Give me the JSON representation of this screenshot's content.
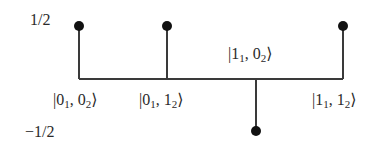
{
  "diagram": {
    "y_labels": {
      "top": "1/2",
      "bottom": "−1/2"
    },
    "baseline": {
      "x1": 79,
      "x2": 343,
      "y": 79
    },
    "stems": [
      {
        "state": "|0₁, 0₂⟩",
        "x": 79,
        "value": 0.5,
        "dot_y": 26
      },
      {
        "state": "|0₁, 1₂⟩",
        "x": 167,
        "value": 0.5,
        "dot_y": 26
      },
      {
        "state": "|1₁, 0₂⟩",
        "x": 256,
        "value": -0.5,
        "dot_y": 131
      },
      {
        "state": "|1₁, 1₂⟩",
        "x": 343,
        "value": 0.5,
        "dot_y": 26
      }
    ],
    "state_labels": [
      {
        "prefix": "|0",
        "sub1": "1",
        "mid": ", 0",
        "sub2": "2",
        "suffix": "⟩"
      },
      {
        "prefix": "|0",
        "sub1": "1",
        "mid": ", 1",
        "sub2": "2",
        "suffix": "⟩"
      },
      {
        "prefix": "|1",
        "sub1": "1",
        "mid": ", 0",
        "sub2": "2",
        "suffix": "⟩"
      },
      {
        "prefix": "|1",
        "sub1": "1",
        "mid": ", 1",
        "sub2": "2",
        "suffix": "⟩"
      }
    ],
    "colors": {
      "line": "#3a3a3a",
      "dot": "#111111",
      "text": "#2a2a2a"
    }
  }
}
